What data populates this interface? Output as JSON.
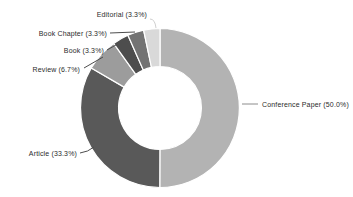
{
  "chart_data": {
    "type": "pie",
    "subtype": "donut",
    "title": "",
    "xlabel": "",
    "ylabel": "",
    "legend_position": "outside-labels-with-leader-lines",
    "background": "#ffffff",
    "label_color": "#2b2b2b",
    "categories": [
      "Conference Paper",
      "Article",
      "Review",
      "Book",
      "Book Chapter",
      "Editorial"
    ],
    "values": [
      50.0,
      33.3,
      6.7,
      3.3,
      3.3,
      3.3
    ],
    "slices": [
      {
        "name": "Conference Paper",
        "label": "Conference Paper  (50.0%)",
        "value": 50.0,
        "color": "#b3b3b3",
        "leader_color": "#8c8c8c"
      },
      {
        "name": "Article",
        "label": "Article (33.3%)",
        "value": 33.3,
        "color": "#595959",
        "leader_color": "#4d4d4d"
      },
      {
        "name": "Review",
        "label": "Review (6.7%)",
        "value": 6.7,
        "color": "#9c9c9c",
        "leader_color": "#4d4d4d"
      },
      {
        "name": "Book",
        "label": "Book (3.3%)",
        "value": 3.3,
        "color": "#4d4d4d",
        "leader_color": "#4d4d4d"
      },
      {
        "name": "Book Chapter",
        "label": "Book Chapter (3.3%)",
        "value": 3.3,
        "color": "#737373",
        "leader_color": "#4d4d4d"
      },
      {
        "name": "Editorial",
        "label": "Editorial (3.3%)",
        "value": 3.3,
        "color": "#d9d9d9",
        "leader_color": "#d0d0d0"
      }
    ]
  }
}
